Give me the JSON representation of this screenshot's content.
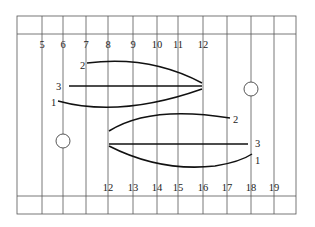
{
  "diagram": {
    "frame": {
      "left": 17,
      "right": 296,
      "top": 16,
      "header_line": 34,
      "footer_line": 196,
      "bottom": 214
    },
    "vertical_lines_x": [
      42,
      63,
      86,
      108,
      133,
      157,
      178,
      203,
      227,
      251,
      274
    ],
    "top_labels": [
      {
        "text": "5",
        "x": 42
      },
      {
        "text": "6",
        "x": 63
      },
      {
        "text": "7",
        "x": 86
      },
      {
        "text": "8",
        "x": 108
      },
      {
        "text": "9",
        "x": 133
      },
      {
        "text": "10",
        "x": 157
      },
      {
        "text": "11",
        "x": 178
      },
      {
        "text": "12",
        "x": 203
      }
    ],
    "bottom_labels": [
      {
        "text": "12",
        "x": 108
      },
      {
        "text": "13",
        "x": 133
      },
      {
        "text": "14",
        "x": 157
      },
      {
        "text": "15",
        "x": 178
      },
      {
        "text": "16",
        "x": 203
      },
      {
        "text": "17",
        "x": 227
      },
      {
        "text": "18",
        "x": 251
      },
      {
        "text": "19",
        "x": 274
      }
    ],
    "upper_group": {
      "curves": [
        {
          "id": "2",
          "label": "2",
          "label_x": 80,
          "label_y": 69,
          "path": "M 87 63 Q 150 55 202 83"
        },
        {
          "id": "3",
          "label": "3",
          "label_x": 56,
          "label_y": 90,
          "path": "M 69 86 L 202 86"
        },
        {
          "id": "1",
          "label": "1",
          "label_x": 51,
          "label_y": 106,
          "path": "M 58 101 Q 120 118 202 89"
        }
      ]
    },
    "lower_group": {
      "curves": [
        {
          "id": "2",
          "label": "2",
          "label_x": 233,
          "label_y": 123,
          "path": "M 109 131 Q 150 105 230 118"
        },
        {
          "id": "3",
          "label": "3",
          "label_x": 255,
          "label_y": 147,
          "path": "M 109 144 L 248 144"
        },
        {
          "id": "1",
          "label": "1",
          "label_x": 255,
          "label_y": 164,
          "path": "M 109 146 Q 160 172 215 166 Q 240 162 252 154"
        }
      ]
    },
    "holes": [
      {
        "name": "left-hole",
        "cx": 63,
        "cy": 141,
        "r": 7
      },
      {
        "name": "right-hole",
        "cx": 251,
        "cy": 89,
        "r": 7
      }
    ]
  }
}
